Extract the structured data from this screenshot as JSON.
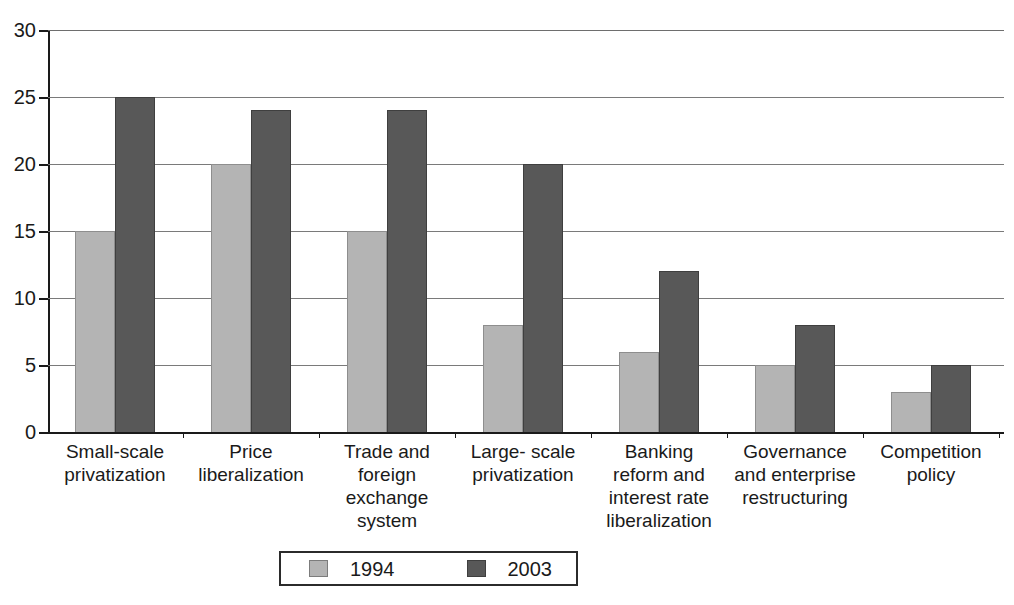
{
  "chart_data": {
    "type": "bar",
    "title": "",
    "subtitle": "",
    "xlabel": "",
    "ylabel": "",
    "ylim": [
      0,
      30
    ],
    "ytick_values": [
      0,
      5,
      10,
      15,
      20,
      25,
      30
    ],
    "ytick_labels": [
      "0",
      "5",
      "10",
      "15",
      "20",
      "25",
      "30"
    ],
    "grid": "horizontal",
    "legend_position": "bottom-center",
    "categories": [
      "Small-scale\nprivatization",
      "Price\nliberalization",
      "Trade and\nforeign\nexchange\nsystem",
      "Large- scale\nprivatization",
      "Banking\nreform and\ninterest rate\nliberalization",
      "Governance\nand enterprise\nrestructuring",
      "Competition\npolicy"
    ],
    "category_lines": [
      [
        "Small-scale",
        "privatization"
      ],
      [
        "Price",
        "liberalization"
      ],
      [
        "Trade and",
        "foreign",
        "exchange",
        "system"
      ],
      [
        "Large- scale",
        "privatization"
      ],
      [
        "Banking",
        "reform and",
        "interest rate",
        "liberalization"
      ],
      [
        "Governance",
        "and enterprise",
        "restructuring"
      ],
      [
        "Competition",
        "policy"
      ]
    ],
    "series": [
      {
        "name": "1994",
        "color": "#b4b4b4",
        "values": [
          15,
          20,
          15,
          8,
          6,
          5,
          3
        ]
      },
      {
        "name": "2003",
        "color": "#585858",
        "values": [
          25,
          24,
          24,
          20,
          12,
          8,
          5
        ]
      }
    ]
  },
  "legend": {
    "items": [
      {
        "label": "1994",
        "color": "#b4b4b4"
      },
      {
        "label": "2003",
        "color": "#585858"
      }
    ]
  },
  "colors": {
    "series_1994": "#b4b4b4",
    "series_2003": "#585858",
    "axis": "#1a1a1a",
    "gridline": "#7a7a7a",
    "background": "#ffffff"
  }
}
